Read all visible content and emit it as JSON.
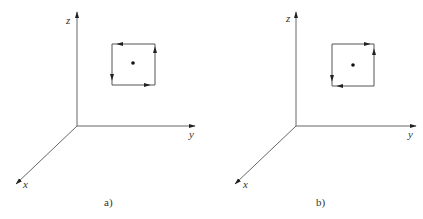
{
  "panels": [
    {
      "caption": "a)",
      "axes": {
        "x": "x",
        "y": "y",
        "z": "z"
      },
      "loop_direction": "counterclockwise",
      "center_point": "dot"
    },
    {
      "caption": "b)",
      "axes": {
        "x": "x",
        "y": "y",
        "z": "z"
      },
      "loop_direction": "clockwise",
      "center_point": "dot"
    }
  ],
  "colors": {
    "line": "#555555",
    "arrow": "#222222",
    "background": "#ffffff"
  }
}
